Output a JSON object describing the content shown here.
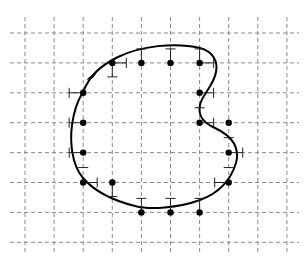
{
  "diagram": {
    "grid": {
      "columns": 10,
      "rows": 8,
      "style": "dashed",
      "color": "#8a8a8a"
    },
    "curve": {
      "closed": true,
      "color": "#000000",
      "orientation": "clockwise",
      "direction_arrow": "arrow-on-curve"
    },
    "lattice_points": [
      {
        "col": 3,
        "row": 1
      },
      {
        "col": 4,
        "row": 1
      },
      {
        "col": 5,
        "row": 1
      },
      {
        "col": 6,
        "row": 1
      },
      {
        "col": 2,
        "row": 2
      },
      {
        "col": 6,
        "row": 2
      },
      {
        "col": 2,
        "row": 3
      },
      {
        "col": 6,
        "row": 3
      },
      {
        "col": 7,
        "row": 3
      },
      {
        "col": 2,
        "row": 4
      },
      {
        "col": 7,
        "row": 4
      },
      {
        "col": 2,
        "row": 5
      },
      {
        "col": 3,
        "row": 5
      },
      {
        "col": 7,
        "row": 5
      },
      {
        "col": 4,
        "row": 6
      },
      {
        "col": 5,
        "row": 6
      },
      {
        "col": 6,
        "row": 6
      }
    ],
    "ticks": [
      {
        "col": 2,
        "row": 2,
        "dir": "left"
      },
      {
        "col": 3,
        "row": 1,
        "dir": "down"
      },
      {
        "col": 3,
        "row": 1,
        "dir": "right"
      },
      {
        "col": 4,
        "row": 1,
        "dir": "up"
      },
      {
        "col": 5,
        "row": 1,
        "dir": "up"
      },
      {
        "col": 6,
        "row": 1,
        "dir": "up"
      },
      {
        "col": 6,
        "row": 1,
        "dir": "right"
      },
      {
        "col": 6,
        "row": 2,
        "dir": "right"
      },
      {
        "col": 6,
        "row": 2.5,
        "dir": "mark"
      },
      {
        "col": 6,
        "row": 3,
        "dir": "right"
      },
      {
        "col": 7,
        "row": 3.5,
        "dir": "mark"
      },
      {
        "col": 7,
        "row": 4,
        "dir": "right"
      },
      {
        "col": 7,
        "row": 4.5,
        "dir": "mark"
      },
      {
        "col": 7,
        "row": 5,
        "dir": "left"
      },
      {
        "col": 4,
        "row": 6,
        "dir": "up"
      },
      {
        "col": 5,
        "row": 6,
        "dir": "up"
      },
      {
        "col": 6,
        "row": 6,
        "dir": "up"
      },
      {
        "col": 3,
        "row": 5,
        "dir": "down"
      },
      {
        "col": 2,
        "row": 5,
        "dir": "right"
      },
      {
        "col": 2,
        "row": 4.5,
        "dir": "mark"
      },
      {
        "col": 2,
        "row": 4,
        "dir": "left"
      },
      {
        "col": 2,
        "row": 3,
        "dir": "left"
      }
    ]
  }
}
